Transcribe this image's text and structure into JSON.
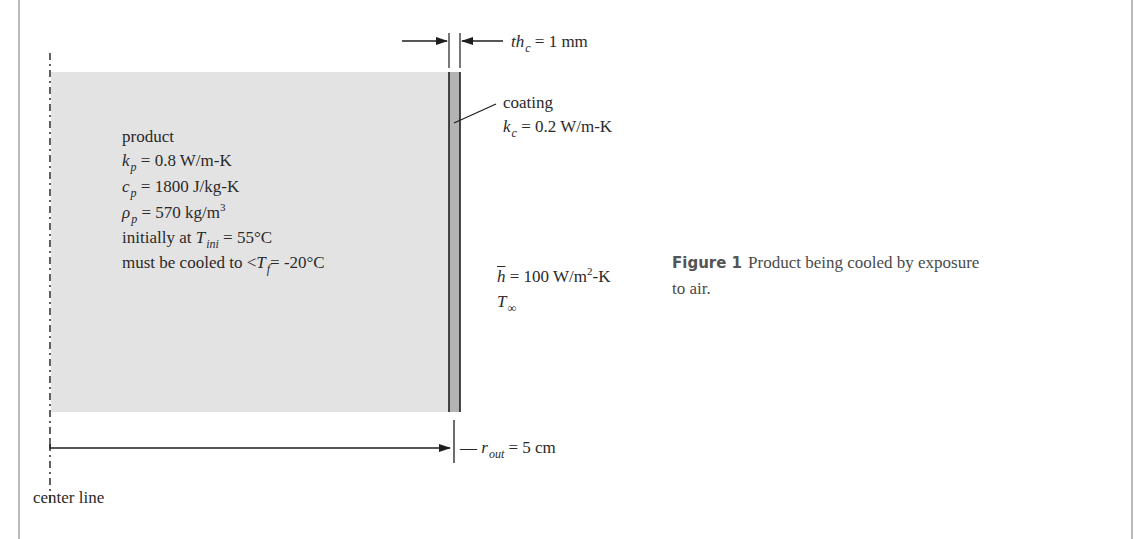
{
  "figure": {
    "label": "Figure 1",
    "caption_line1": "Product being cooled by exposure",
    "caption_line2": "to air."
  },
  "colors": {
    "product_fill": "#e3e3e3",
    "coating_fill": "#b3b3b3",
    "line": "#1e1e1e",
    "frame": "#8c8c8c"
  },
  "dimensions": {
    "coating_thickness": {
      "symbol": "th",
      "subscript": "c",
      "value": "= 1 mm"
    },
    "outer_radius": {
      "prefix": "—",
      "symbol": "r",
      "subscript": "out",
      "value": "= 5 cm"
    }
  },
  "coating": {
    "label": "coating",
    "conductivity": {
      "symbol": "k",
      "subscript": "c",
      "value": "= 0.2 W/m-K"
    }
  },
  "product": {
    "label": "product",
    "properties": [
      {
        "symbol": "k",
        "subscript": "p",
        "value": "= 0.8 W/m-K"
      },
      {
        "symbol": "c",
        "subscript": "p",
        "value": "= 1800 J/kg-K"
      },
      {
        "symbol": "ρ",
        "subscript": "p",
        "value": "= 570 kg/m",
        "superscript": "3"
      }
    ],
    "initial": {
      "prefix": "initially at ",
      "symbol": "T",
      "subscript": "ini",
      "value": "= 55°C"
    },
    "target": {
      "prefix": "must be cooled to <",
      "symbol": "T",
      "subscript": "f",
      "value": "= -20°C"
    }
  },
  "convection": {
    "h": {
      "symbol": "h",
      "value": "= 100 W/m",
      "superscript": "2",
      "suffix": "-K"
    },
    "ambient": {
      "symbol": "T",
      "subscript": "∞"
    }
  },
  "center_line": {
    "label": "center line"
  }
}
